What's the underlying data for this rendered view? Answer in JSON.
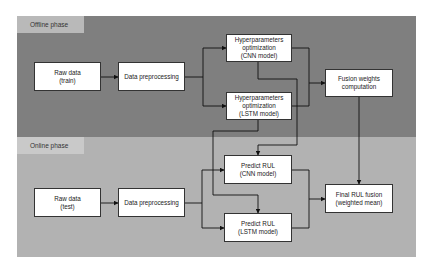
{
  "phases": {
    "offline": {
      "label": "Offline phase",
      "color": "#7f7f7f",
      "label_color": "#b9b9b9"
    },
    "online": {
      "label": "Online phase",
      "color": "#b2b2b2",
      "label_color": "#c9c9c9"
    }
  },
  "nodes": {
    "raw_train": "Raw data\n(train)",
    "preproc_offline": "Data preprocessing",
    "hyper_cnn": "Hyperparameters\noptimization\n(CNN model)",
    "hyper_lstm": "Hyperparameters\noptimization\n(LSTM model)",
    "fusion_weights": "Fusion weights\ncomputation",
    "raw_test": "Raw data\n(test)",
    "preproc_online": "Data preprocessing",
    "predict_cnn": "Predict RUL\n(CNN model)",
    "predict_lstm": "Predict RUL\n(LSTM model)",
    "final_fusion": "Final RUL fusion\n(weighted mean)"
  },
  "edges": [
    [
      "raw_train",
      "preproc_offline"
    ],
    [
      "preproc_offline",
      "hyper_cnn"
    ],
    [
      "preproc_offline",
      "hyper_lstm"
    ],
    [
      "hyper_cnn",
      "fusion_weights"
    ],
    [
      "hyper_lstm",
      "fusion_weights"
    ],
    [
      "hyper_cnn",
      "predict_cnn"
    ],
    [
      "hyper_lstm",
      "predict_lstm"
    ],
    [
      "fusion_weights",
      "final_fusion"
    ],
    [
      "raw_test",
      "preproc_online"
    ],
    [
      "preproc_online",
      "predict_cnn"
    ],
    [
      "preproc_online",
      "predict_lstm"
    ],
    [
      "predict_cnn",
      "final_fusion"
    ],
    [
      "predict_lstm",
      "final_fusion"
    ]
  ]
}
